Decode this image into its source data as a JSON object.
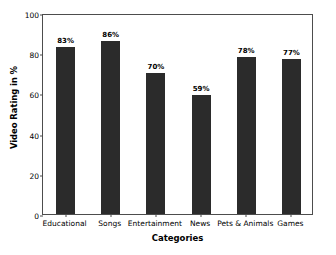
{
  "chart_data": {
    "type": "bar",
    "title": "",
    "xlabel": "Categories",
    "ylabel": "Video Rating in %",
    "categories": [
      "Educational",
      "Songs",
      "Entertainment",
      "News",
      "Pets & Animals",
      "Games"
    ],
    "values": [
      83,
      86,
      70,
      59,
      78,
      77
    ],
    "data_labels": [
      "83%",
      "86%",
      "70%",
      "59%",
      "78%",
      "77%"
    ],
    "ylim": [
      0,
      100
    ],
    "yticks": [
      0,
      20,
      40,
      60,
      80,
      100
    ],
    "ytick_labels": [
      "0",
      "20",
      "40",
      "60",
      "80",
      "100"
    ],
    "grid": false,
    "legend": null,
    "bar_color": "#2b2b2b",
    "axis_color": "#4d4d4d",
    "background": "#ffffff"
  }
}
